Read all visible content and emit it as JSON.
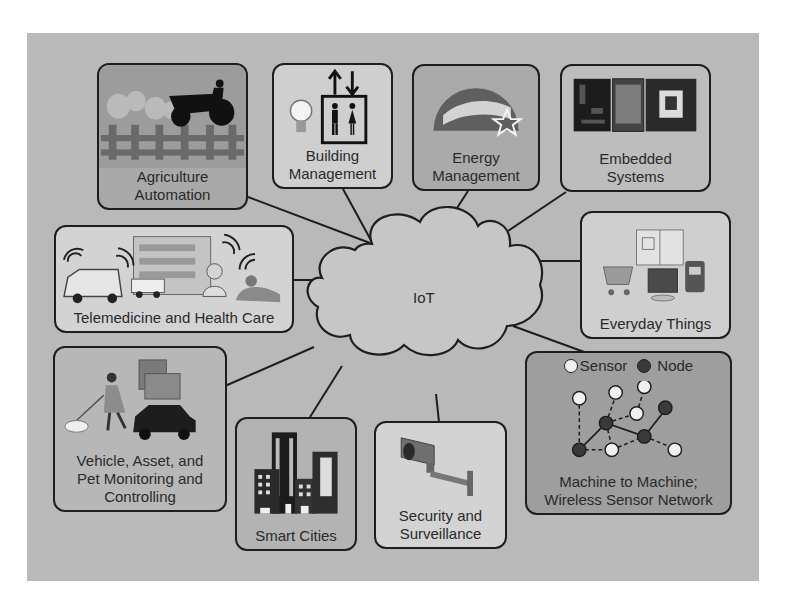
{
  "diagram": {
    "hub": {
      "label": "IoT",
      "icon": "cloud-icon"
    },
    "colors": {
      "panel": "#b9b9b9",
      "box_dark": "#a9a9a9",
      "box_mid": "#b4b4b4",
      "box_light": "#d6d6d6",
      "outline": "#1e1e1e",
      "text": "#2a2a2a"
    },
    "nodes": [
      {
        "id": "agriculture",
        "label": "Agriculture\nAutomation",
        "icon": "tractor-fence-icon"
      },
      {
        "id": "building",
        "label": "Building\nManagement",
        "icon": "elevator-lightbulb-icon"
      },
      {
        "id": "energy",
        "label": "Energy\nManagement",
        "icon": "energy-star-icon"
      },
      {
        "id": "embedded",
        "label": "Embedded\nSystems",
        "icon": "circuit-board-chip-icon"
      },
      {
        "id": "telemedicine",
        "label": "Telemedicine and Health Care",
        "icon": "ambulance-hospital-icon"
      },
      {
        "id": "everyday",
        "label": "Everyday Things",
        "icon": "appliances-cart-icon"
      },
      {
        "id": "vehicle",
        "label": "Vehicle, Asset, and\nPet Monitoring and\nControlling",
        "icon": "dog-walker-car-icon"
      },
      {
        "id": "smartcities",
        "label": "Smart Cities",
        "icon": "city-buildings-icon"
      },
      {
        "id": "security",
        "label": "Security and\nSurveillance",
        "icon": "security-camera-icon"
      },
      {
        "id": "m2m",
        "label": "Machine to Machine;\nWireless Sensor Network",
        "icon": "sensor-network-icon",
        "legend": {
          "sensor": "Sensor",
          "node": "Node"
        }
      }
    ]
  }
}
